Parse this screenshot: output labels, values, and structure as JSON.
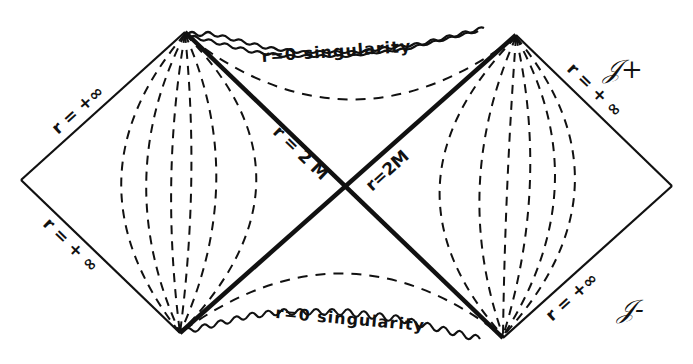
{
  "diagram": {
    "type": "Penrose diagram (Schwarzschild / Kruskal extension)",
    "labels": {
      "left_upper_boundary": "r = +∞",
      "left_lower_boundary": "r = + ∞",
      "right_upper_boundary": "r = + ∞",
      "right_lower_boundary": "r = +∞",
      "horizon_left": "r = 2 M",
      "horizon_right": "r=2M",
      "top_singularity": "r=0 singularity",
      "bottom_singularity": "r=0 singularity",
      "future_null_infinity": "𝒥+",
      "past_null_infinity": "𝒥-"
    },
    "colors": {
      "ink": "#111111",
      "background": "#ffffff"
    }
  }
}
